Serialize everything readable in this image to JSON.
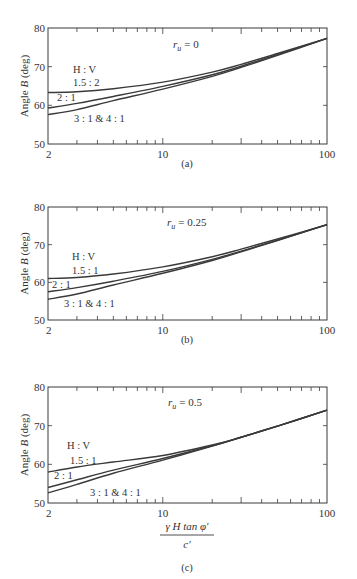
{
  "figure": {
    "y_axis_label": "Angle B (deg)",
    "x_axis_label_numerator": "γ H tan φ′",
    "x_axis_label_denominator": "c′",
    "legend_header": "H : V"
  },
  "chart_data": [
    {
      "type": "line",
      "panel": "(a)",
      "annotation": "r_u = 0",
      "annotation_symbol": "r",
      "annotation_sub": "u",
      "annotation_value": "= 0",
      "xscale": "log",
      "xlim": [
        2,
        100
      ],
      "ylim": [
        50,
        80
      ],
      "xticks": [
        "2",
        "10",
        "100"
      ],
      "yticks": [
        "50",
        "60",
        "70",
        "80"
      ],
      "ylabel": "Angle B (deg)",
      "xlabel": "",
      "legend_title": "H : V",
      "x": [
        2,
        3,
        5,
        10,
        20,
        30,
        50,
        100
      ],
      "series": [
        {
          "name": "1.5 : 2",
          "values": [
            63.3,
            63.5,
            64.3,
            66.0,
            68.6,
            70.6,
            73.4,
            77.3
          ]
        },
        {
          "name": "2 : 1",
          "values": [
            59.3,
            60.5,
            62.3,
            64.9,
            67.9,
            70.1,
            73.1,
            77.3
          ]
        },
        {
          "name": "3 : 1 & 4 : 1",
          "values": [
            57.6,
            58.9,
            61.2,
            64.2,
            67.5,
            69.8,
            72.9,
            77.3
          ]
        }
      ],
      "labels": [
        "1.5 : 2",
        "2 : 1",
        "3 : 1 & 4 : 1"
      ]
    },
    {
      "type": "line",
      "panel": "(b)",
      "annotation": "r_u = 0.25",
      "annotation_symbol": "r",
      "annotation_sub": "u",
      "annotation_value": "= 0.25",
      "xscale": "log",
      "xlim": [
        2,
        100
      ],
      "ylim": [
        50,
        80
      ],
      "xticks": [
        "2",
        "10",
        "100"
      ],
      "yticks": [
        "50",
        "60",
        "70",
        "80"
      ],
      "ylabel": "Angle B (deg)",
      "xlabel": "",
      "legend_title": "H : V",
      "x": [
        2,
        3,
        5,
        10,
        20,
        30,
        50,
        100
      ],
      "series": [
        {
          "name": "1.5 : 1",
          "values": [
            61.0,
            61.3,
            62.2,
            64.1,
            66.8,
            68.8,
            71.5,
            75.3
          ]
        },
        {
          "name": "2 : 1",
          "values": [
            57.5,
            58.6,
            60.3,
            62.9,
            66.1,
            68.3,
            71.2,
            75.3
          ]
        },
        {
          "name": "3 : 1 & 4 : 1",
          "values": [
            55.5,
            56.9,
            59.3,
            62.4,
            65.8,
            68.1,
            71.1,
            75.3
          ]
        }
      ],
      "labels": [
        "1.5 : 1",
        "2 : 1",
        "3 : 1 & 4 : 1"
      ]
    },
    {
      "type": "line",
      "panel": "(c)",
      "annotation": "r_u = 0.5",
      "annotation_symbol": "r",
      "annotation_sub": "u",
      "annotation_value": "= 0.5",
      "xscale": "log",
      "xlim": [
        2,
        100
      ],
      "ylim": [
        50,
        80
      ],
      "xticks": [
        "2",
        "10",
        "100"
      ],
      "yticks": [
        "50",
        "60",
        "70",
        "80"
      ],
      "ylabel": "Angle B (deg)",
      "xlabel": "γ H tan φ′ / c′",
      "legend_title": "H : V",
      "x": [
        2,
        3,
        5,
        10,
        20,
        30,
        50,
        100
      ],
      "series": [
        {
          "name": "1.5 : 1",
          "values": [
            58.0,
            59.3,
            60.6,
            62.3,
            65.0,
            67.0,
            69.9,
            74.0
          ]
        },
        {
          "name": "2 : 1",
          "values": [
            54.0,
            56.0,
            58.5,
            61.5,
            64.8,
            67.0,
            69.9,
            74.0
          ]
        },
        {
          "name": "3 : 1 & 4 : 1",
          "values": [
            52.6,
            54.8,
            57.7,
            61.1,
            64.7,
            67.0,
            69.9,
            74.0
          ]
        }
      ],
      "labels": [
        "1.5 : 1",
        "2 : 1",
        "3 : 1 & 4 : 1"
      ]
    }
  ]
}
